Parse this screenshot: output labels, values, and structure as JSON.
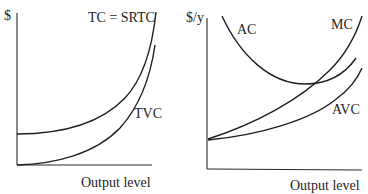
{
  "panels": {
    "left": {
      "y_axis_label": "$",
      "x_axis_label": "Output level",
      "curves": [
        {
          "id": "tc",
          "label": "TC = SRTC"
        },
        {
          "id": "tvc",
          "label": "TVC"
        }
      ]
    },
    "right": {
      "y_axis_label": "$/y",
      "x_axis_label": "Output level",
      "curves": [
        {
          "id": "ac",
          "label": "AC"
        },
        {
          "id": "mc",
          "label": "MC"
        },
        {
          "id": "avc",
          "label": "AVC"
        }
      ]
    }
  },
  "colors": {
    "line": "#1e1e1e",
    "background": "#ffffff"
  }
}
